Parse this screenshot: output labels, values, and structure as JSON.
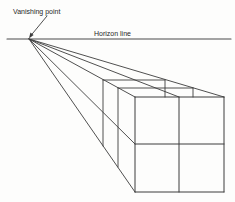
{
  "diagram": {
    "type": "one-point-perspective-construction",
    "labels": {
      "vanishing_point": "Vanishing point",
      "horizon_line": "Horizon line"
    },
    "colors": {
      "line": "#3c3c3c",
      "horizon": "#4a4a4a",
      "text": "#1f1f1f",
      "background": "#fdfdfc"
    },
    "label_positions": {
      "vanishing_point": {
        "x": 13,
        "y": 14
      },
      "horizon_line": {
        "x": 94,
        "y": 35.5
      }
    },
    "vanishing_point_xy": [
      29,
      39
    ],
    "front_face": {
      "left": 135,
      "right": 224,
      "top": 97,
      "bottom": 192
    },
    "depth_scales": [
      0.84,
      0.7
    ],
    "lines": [
      {
        "name": "horizon-line",
        "x1": 7,
        "y1": 39,
        "x2": 231,
        "y2": 39,
        "w": 1.1
      },
      {
        "name": "vp-arrow-shaft",
        "x1": 47,
        "y1": 16,
        "x2": 30.5,
        "y2": 36,
        "w": 0.9
      },
      {
        "name": "receding-line-top-right",
        "x1": 29,
        "y1": 39,
        "x2": 224,
        "y2": 97,
        "w": 0.9
      },
      {
        "name": "receding-line-top-mid",
        "x1": 29,
        "y1": 39,
        "x2": 179,
        "y2": 97,
        "w": 0.9
      },
      {
        "name": "receding-line-top-left",
        "x1": 29,
        "y1": 39,
        "x2": 135,
        "y2": 97,
        "w": 0.9
      },
      {
        "name": "receding-line-mid-left",
        "x1": 29,
        "y1": 39,
        "x2": 135,
        "y2": 144,
        "w": 0.9
      },
      {
        "name": "receding-line-bottom-left",
        "x1": 29,
        "y1": 39,
        "x2": 135,
        "y2": 192,
        "w": 0.9
      },
      {
        "name": "cube-front-top-edge",
        "x1": 135,
        "y1": 97,
        "x2": 224,
        "y2": 97,
        "w": 1.0
      },
      {
        "name": "cube-front-bottom-edge",
        "x1": 135,
        "y1": 192,
        "x2": 224,
        "y2": 192,
        "w": 1.0
      },
      {
        "name": "cube-front-left-edge",
        "x1": 135,
        "y1": 97,
        "x2": 135,
        "y2": 192,
        "w": 1.0
      },
      {
        "name": "cube-front-right-edge",
        "x1": 224,
        "y1": 97,
        "x2": 224,
        "y2": 192,
        "w": 1.0
      },
      {
        "name": "cube-front-mid-vertical",
        "x1": 179,
        "y1": 97,
        "x2": 179,
        "y2": 192,
        "w": 1.0
      },
      {
        "name": "cube-front-mid-horizontal",
        "x1": 135,
        "y1": 144,
        "x2": 224,
        "y2": 144,
        "w": 1.0
      },
      {
        "name": "back-face1-top-edge",
        "x1": 118,
        "y1": 88,
        "x2": 193,
        "y2": 88,
        "w": 0.9
      },
      {
        "name": "back-face1-left-edge",
        "x1": 118,
        "y1": 88,
        "x2": 118,
        "y2": 167,
        "w": 0.9
      },
      {
        "name": "back-face1-right-stub",
        "x1": 193,
        "y1": 88,
        "x2": 193,
        "y2": 97,
        "w": 0.9
      },
      {
        "name": "back-face2-top-edge",
        "x1": 103,
        "y1": 80,
        "x2": 165,
        "y2": 80,
        "w": 0.9
      },
      {
        "name": "back-face2-left-edge",
        "x1": 103,
        "y1": 80,
        "x2": 103,
        "y2": 146,
        "w": 0.9
      },
      {
        "name": "back-face2-right-stub",
        "x1": 165,
        "y1": 80,
        "x2": 165,
        "y2": 97,
        "w": 0.9
      }
    ],
    "arrowhead_points": "29,38.5 33.6,35.0 30.4,32.5"
  }
}
